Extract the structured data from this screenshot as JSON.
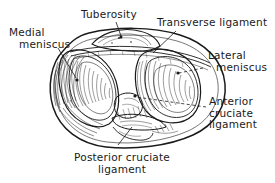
{
  "figure": {
    "view": "superior view of right tibial plateau",
    "background_color": "#ffffff",
    "ink_color": "#1a1a1a",
    "width": 275,
    "height": 183
  },
  "labels": {
    "tuberosity": {
      "line1": "Tuberosity"
    },
    "transverse_ligament": {
      "line1": "Transverse ligament"
    },
    "medial_meniscus": {
      "line1": "Medial",
      "line2": "meniscus"
    },
    "lateral_meniscus": {
      "line1": "Lateral",
      "line2": "meniscus"
    },
    "anterior_cruciate_ligament": {
      "line1": "Anterior",
      "line2": "cruciate",
      "line3": "ligament"
    },
    "posterior_cruciate_ligament": {
      "line1": "Posterior cruciate",
      "line2": "ligament"
    }
  }
}
